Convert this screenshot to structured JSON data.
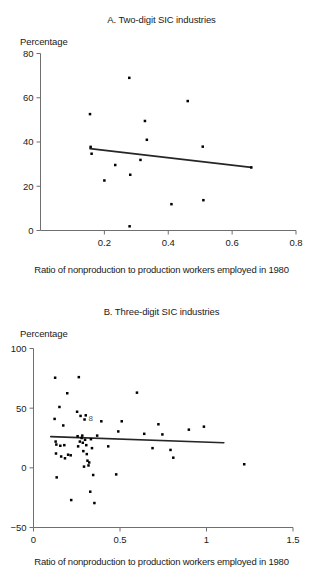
{
  "figure": {
    "shared_xlabel": "Ratio of nonproduction to production workers employed in 1980",
    "shared_ylabel": "Percentage"
  },
  "chart_data": [
    {
      "type": "scatter",
      "panel": "A",
      "title": "A. Two-digit SIC industries",
      "xlabel": "Ratio of nonproduction to production workers employed in 1980",
      "ylabel": "Percentage",
      "xlim": [
        0.0,
        0.8
      ],
      "ylim": [
        0,
        80
      ],
      "xticks": [
        0.2,
        0.4,
        0.6,
        0.8
      ],
      "xtick_labels": [
        "0.2",
        "0.4",
        "0.6",
        "0.8"
      ],
      "yticks": [
        0,
        20,
        40,
        60,
        80
      ],
      "ytick_labels": [
        "0",
        "20",
        "40",
        "60",
        "80"
      ],
      "grid": false,
      "legend": "none",
      "marker": "filled-square",
      "points": [
        {
          "x": 0.155,
          "y": 52.6
        },
        {
          "x": 0.157,
          "y": 37.8
        },
        {
          "x": 0.16,
          "y": 34.7
        },
        {
          "x": 0.2,
          "y": 22.6
        },
        {
          "x": 0.234,
          "y": 29.6
        },
        {
          "x": 0.278,
          "y": 69.0
        },
        {
          "x": 0.279,
          "y": 1.9
        },
        {
          "x": 0.281,
          "y": 25.2
        },
        {
          "x": 0.313,
          "y": 31.9
        },
        {
          "x": 0.327,
          "y": 49.5
        },
        {
          "x": 0.333,
          "y": 41.0
        },
        {
          "x": 0.41,
          "y": 11.9
        },
        {
          "x": 0.461,
          "y": 58.5
        },
        {
          "x": 0.508,
          "y": 37.9
        },
        {
          "x": 0.51,
          "y": 13.7
        },
        {
          "x": 0.66,
          "y": 28.5
        }
      ],
      "trendline": {
        "x0": 0.155,
        "y0": 37.0,
        "x1": 0.66,
        "y1": 28.5
      }
    },
    {
      "type": "scatter",
      "panel": "B",
      "title": "B. Three-digit SIC industries",
      "xlabel": "Ratio of nonproduction to production workers employed in 1980",
      "ylabel": "Percentage",
      "xlim": [
        0.0,
        1.5
      ],
      "ylim": [
        -50,
        100
      ],
      "xticks": [
        0,
        0.5,
        1,
        1.5
      ],
      "xtick_labels": [
        "0",
        "0.5",
        "1",
        "1.5"
      ],
      "yticks": [
        -50,
        0,
        50,
        100
      ],
      "ytick_labels": [
        "−50",
        "0",
        "50",
        "100"
      ],
      "grid": false,
      "legend": "none",
      "marker": "filled-square",
      "points": [
        {
          "x": 0.122,
          "y": 41.0
        },
        {
          "x": 0.125,
          "y": 75.5
        },
        {
          "x": 0.128,
          "y": 22.0
        },
        {
          "x": 0.13,
          "y": 12.0
        },
        {
          "x": 0.132,
          "y": 19.5
        },
        {
          "x": 0.134,
          "y": -8.0
        },
        {
          "x": 0.15,
          "y": 51.0
        },
        {
          "x": 0.155,
          "y": 18.5
        },
        {
          "x": 0.16,
          "y": 9.5
        },
        {
          "x": 0.172,
          "y": 35.5
        },
        {
          "x": 0.178,
          "y": 19.0
        },
        {
          "x": 0.182,
          "y": 8.0
        },
        {
          "x": 0.195,
          "y": 62.5
        },
        {
          "x": 0.2,
          "y": 11.0
        },
        {
          "x": 0.215,
          "y": 10.5
        },
        {
          "x": 0.218,
          "y": -27.0
        },
        {
          "x": 0.252,
          "y": 47.0
        },
        {
          "x": 0.255,
          "y": 26.5
        },
        {
          "x": 0.258,
          "y": 18.0
        },
        {
          "x": 0.262,
          "y": 76.0
        },
        {
          "x": 0.268,
          "y": 22.0
        },
        {
          "x": 0.272,
          "y": 43.5
        },
        {
          "x": 0.278,
          "y": 25.0
        },
        {
          "x": 0.282,
          "y": 27.0
        },
        {
          "x": 0.285,
          "y": 21.0
        },
        {
          "x": 0.288,
          "y": 14.0
        },
        {
          "x": 0.292,
          "y": 1.0
        },
        {
          "x": 0.295,
          "y": 40.5
        },
        {
          "x": 0.298,
          "y": 23.5
        },
        {
          "x": 0.302,
          "y": 44.0
        },
        {
          "x": 0.305,
          "y": 19.0
        },
        {
          "x": 0.308,
          "y": 11.5
        },
        {
          "x": 0.312,
          "y": 6.0
        },
        {
          "x": 0.318,
          "y": 2.0
        },
        {
          "x": 0.322,
          "y": 4.5
        },
        {
          "x": 0.328,
          "y": -20.0
        },
        {
          "x": 0.332,
          "y": 24.0
        },
        {
          "x": 0.338,
          "y": 16.5
        },
        {
          "x": 0.345,
          "y": -6.0
        },
        {
          "x": 0.352,
          "y": -29.5
        },
        {
          "x": 0.368,
          "y": 27.0
        },
        {
          "x": 0.392,
          "y": 39.0
        },
        {
          "x": 0.432,
          "y": 18.0
        },
        {
          "x": 0.478,
          "y": -5.5
        },
        {
          "x": 0.49,
          "y": 30.5
        },
        {
          "x": 0.51,
          "y": 39.0
        },
        {
          "x": 0.598,
          "y": 63.0
        },
        {
          "x": 0.64,
          "y": 28.5
        },
        {
          "x": 0.688,
          "y": 16.5
        },
        {
          "x": 0.722,
          "y": 36.5
        },
        {
          "x": 0.745,
          "y": 28.0
        },
        {
          "x": 0.792,
          "y": 15.0
        },
        {
          "x": 0.808,
          "y": 8.5
        },
        {
          "x": 0.898,
          "y": 32.0
        },
        {
          "x": 0.985,
          "y": 34.5
        },
        {
          "x": 1.218,
          "y": 3.0
        }
      ],
      "trendline": {
        "x0": 0.1,
        "y0": 26.2,
        "x1": 1.1,
        "y1": 21.0
      },
      "annotations": [
        {
          "text": "8",
          "x": 0.318,
          "y": 39.5
        }
      ]
    }
  ]
}
